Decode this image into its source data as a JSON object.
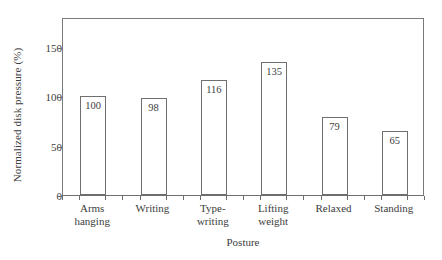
{
  "chart_data": {
    "type": "bar",
    "title": "",
    "xlabel": "Posture",
    "ylabel": "Normalized disk pressure (%)",
    "categories": [
      "Arms\nhanging",
      "Writing",
      "Type-\nwriting",
      "Lifting\nweight",
      "Relaxed",
      "Standing"
    ],
    "values": [
      100,
      98,
      116,
      135,
      79,
      65
    ],
    "value_labels": [
      "100",
      "98",
      "116",
      "135",
      "79",
      "65"
    ],
    "ylim": [
      0,
      180
    ],
    "yticks": [
      0,
      50,
      100,
      150
    ],
    "ytick_labels": [
      "0",
      "50",
      "100",
      "150"
    ],
    "grid": false,
    "legend": null,
    "bar_facecolor": "#ffffff",
    "bar_edgecolor": "#6f6f6f",
    "axis_color": "#7a7a7a",
    "text_color": "#3d3d3d"
  }
}
